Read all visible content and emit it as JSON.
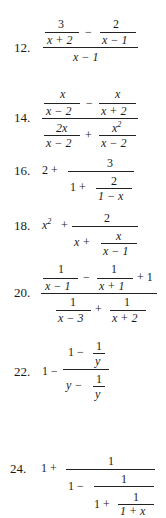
{
  "document": {
    "type": "exercise-list",
    "topic": "Complex fractions",
    "problems": [
      {
        "number": "12.",
        "expression": "(3/(x + 2) - 2/(x - 1)) / (x - 1)",
        "parts": {
          "n1": "3",
          "d1": "x + 2",
          "op1": "−",
          "n2": "2",
          "d2": "x − 1",
          "denominator": "x − 1"
        }
      },
      {
        "number": "14.",
        "expression": "(x/(x - 2) - x/(x + 2)) / (2x/(x - 2) + x^2/(x - 2))",
        "parts": {
          "n1": "x",
          "d1": "x − 2",
          "op1": "−",
          "n2": "x",
          "d2": "x + 2",
          "n3": "2x",
          "d3": "x − 2",
          "op2": "+",
          "n4": "x",
          "n4_exp": "2",
          "d4": "x − 2"
        }
      },
      {
        "number": "16.",
        "expression": "2 + 3/(1 + 2/(1 - x))",
        "parts": {
          "lead": "2 +",
          "num": "3",
          "inner_lead": "1 +",
          "inner_num": "2",
          "inner_den": "1 − x"
        }
      },
      {
        "number": "18.",
        "expression": "x^2 + 2/(x + x/(x - 1))",
        "parts": {
          "lead_base": "x",
          "lead_exp": "2",
          "lead_op": "+",
          "num": "2",
          "inner_lead": "x +",
          "inner_num": "x",
          "inner_den": "x − 1"
        }
      },
      {
        "number": "20.",
        "expression": "(1/(x - 1) - 1/(x + 1) + 1) / (1/(x - 3) + 1/(x + 2))",
        "parts": {
          "n1": "1",
          "d1": "x − 1",
          "op1": "−",
          "n2": "1",
          "d2": "x + 1",
          "tail": "+ 1",
          "n3": "1",
          "d3": "x − 3",
          "op2": "+",
          "n4": "1",
          "d4": "x + 2"
        }
      },
      {
        "number": "22.",
        "expression": "1 - (1 - 1/y)/(y - 1/y)",
        "parts": {
          "lead": "1 −",
          "top_lead": "1 −",
          "top_num": "1",
          "top_den": "y",
          "bot_lead": "y −",
          "bot_num": "1",
          "bot_den": "y"
        }
      },
      {
        "number": "24.",
        "expression": "1 + 1/(1 - 1/(1 + 1/(1 + x)))",
        "parts": {
          "lead": "1 +",
          "num": "1",
          "l2_lead": "1 −",
          "l2_num": "1",
          "l3_lead": "1 +",
          "l3_num": "1",
          "l3_den": "1 + x"
        }
      }
    ]
  }
}
